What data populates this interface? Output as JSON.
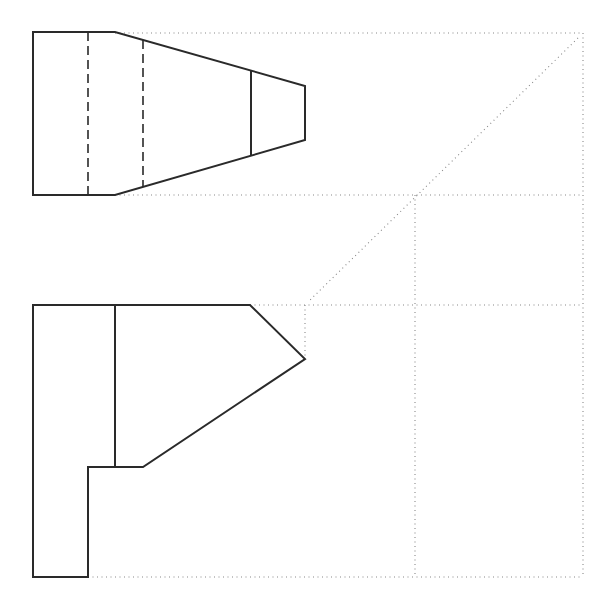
{
  "diagram": {
    "type": "orthographic-projection",
    "colors": {
      "outline": "#2a2a2a",
      "construction": "#888888",
      "background": "#ffffff"
    },
    "top_view": {
      "outline": "33,32 115,32 305,86 305,140 115,195 33,195",
      "hidden_lines": [
        {
          "x1": 88,
          "y1": 32,
          "x2": 88,
          "y2": 195
        },
        {
          "x1": 143,
          "y1": 40,
          "x2": 143,
          "y2": 187
        }
      ],
      "visible_lines": [
        {
          "x1": 251,
          "y1": 71,
          "x2": 251,
          "y2": 156
        }
      ]
    },
    "front_view": {
      "outline": "33,305 250,305 305,359 143,467 88,467 88,577 33,577",
      "visible_lines": [
        {
          "x1": 115,
          "y1": 305,
          "x2": 115,
          "y2": 467
        }
      ]
    },
    "construction_lines": [
      {
        "x1": 115,
        "y1": 33,
        "x2": 583,
        "y2": 33
      },
      {
        "x1": 583,
        "y1": 33,
        "x2": 583,
        "y2": 577
      },
      {
        "x1": 115,
        "y1": 195,
        "x2": 583,
        "y2": 195
      },
      {
        "x1": 578,
        "y1": 38,
        "x2": 308,
        "y2": 302
      },
      {
        "x1": 415,
        "y1": 195,
        "x2": 415,
        "y2": 577
      },
      {
        "x1": 250,
        "y1": 305,
        "x2": 583,
        "y2": 305
      },
      {
        "x1": 305,
        "y1": 305,
        "x2": 305,
        "y2": 357
      },
      {
        "x1": 88,
        "y1": 577,
        "x2": 583,
        "y2": 577
      }
    ]
  }
}
